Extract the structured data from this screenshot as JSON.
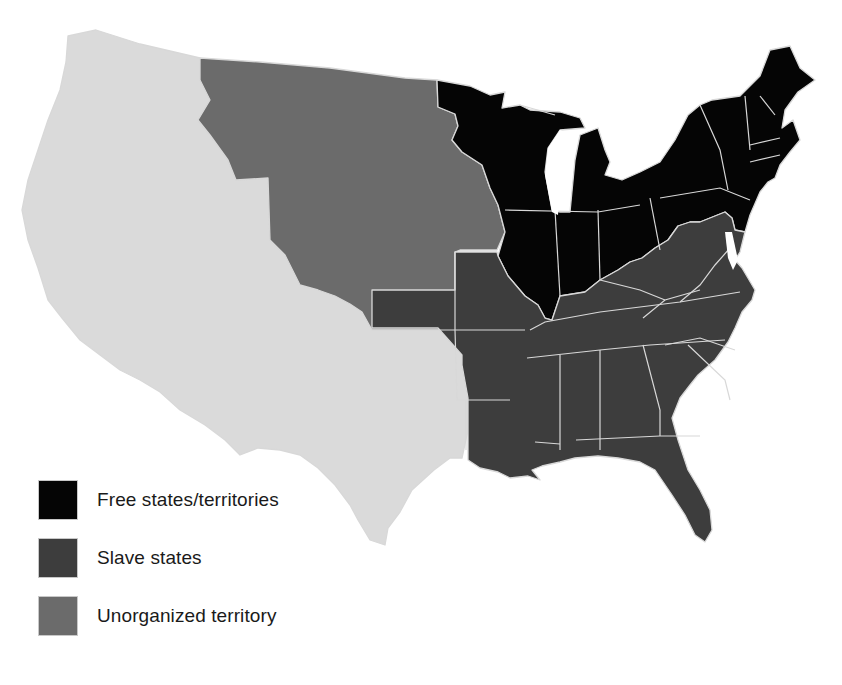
{
  "colors": {
    "free": "#050505",
    "slave": "#3d3d3d",
    "unorganized": "#6b6b6b",
    "other": "#dadada",
    "border": "#d8d8d8",
    "background": "#ffffff"
  },
  "legend": {
    "items": [
      {
        "key": "free",
        "label": "Free states/territories",
        "color": "#050505"
      },
      {
        "key": "slave",
        "label": "Slave states",
        "color": "#3d3d3d"
      },
      {
        "key": "unorganized",
        "label": "Unorganized territory",
        "color": "#6b6b6b"
      }
    ]
  },
  "map": {
    "regions": [
      {
        "name": "western-territory",
        "category": "other"
      },
      {
        "name": "unorganized-territory",
        "category": "unorganized"
      },
      {
        "name": "free-states",
        "category": "free"
      },
      {
        "name": "slave-states",
        "category": "slave"
      }
    ]
  }
}
